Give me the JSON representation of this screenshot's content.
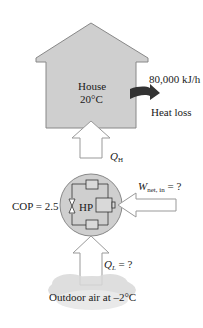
{
  "house": {
    "label": "House",
    "temperature": "20°C"
  },
  "heat_loss": {
    "rate": "80,000 kJ/h",
    "label": "Heat loss"
  },
  "heat_pump": {
    "label": "HP",
    "cop": "COP = 2.5"
  },
  "q_high": {
    "symbol": "Q",
    "subscript": "H"
  },
  "work": {
    "symbol": "W",
    "subscript": "net, in",
    "value": " = ?"
  },
  "q_low": {
    "symbol": "Q",
    "subscript": "L",
    "value": " = ?"
  },
  "outdoor": {
    "label": "Outdoor air at –2°C"
  },
  "colors": {
    "fill": "#cfcfcf",
    "stroke": "#777777",
    "arrow": "#333333",
    "cloud": "#d6d6d6"
  }
}
